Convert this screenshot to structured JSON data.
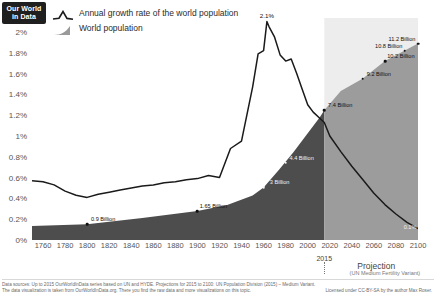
{
  "logo": {
    "line1": "Our World",
    "line2": "in Data"
  },
  "legend": {
    "position": "top-left",
    "items": [
      {
        "label": "Annual growth rate of the world population",
        "icon": "line-peak-icon",
        "color": "#1a1a1a",
        "type": "line"
      },
      {
        "label": "World population",
        "icon": "area-wedge-icon",
        "color": "#9a9a9a",
        "type": "area"
      }
    ]
  },
  "axes": {
    "y_ticks": [
      "0%",
      "0.2%",
      "0.4%",
      "0.6%",
      "0.8%",
      "1%",
      "1.2%",
      "1.4%",
      "1.6%",
      "1.8%",
      "2%"
    ],
    "x_ticks": [
      "1760",
      "1780",
      "1800",
      "1820",
      "1840",
      "1860",
      "1880",
      "1900",
      "1920",
      "1940",
      "1960",
      "1980",
      "2000",
      "2020",
      "2040",
      "2060",
      "2080",
      "2100"
    ]
  },
  "annotations": {
    "marker_year": "2015",
    "projection_title": "Projection",
    "projection_subtitle": "(UN Medium Fertility Variant)",
    "peak_label": "2.1%"
  },
  "footer": {
    "line1": "Data sources: Up to 2015 OurWorldInData series based on UN and HYDE. Projections for 2015 to 2100: UN Population Division (2015) – Medium Variant.",
    "line2": "The data visualization is taken from OurWorldInData.org. There you find the raw data and more visualizations on this topic.",
    "license": "Licensed under CC-BY-SA by the author Max Roser."
  },
  "chart_data": {
    "type": "line",
    "xlabel": "",
    "ylabel": "",
    "xlim": [
      1750,
      2100
    ],
    "ylim": [
      0,
      2.1
    ],
    "grid": false,
    "legend_position": "top-left",
    "series": [
      {
        "name": "Annual growth rate of the world population",
        "unit": "%",
        "color": "#1a1a1a",
        "type": "line",
        "axis": "left",
        "x": [
          1750,
          1760,
          1770,
          1780,
          1790,
          1800,
          1810,
          1820,
          1830,
          1840,
          1850,
          1860,
          1870,
          1880,
          1890,
          1900,
          1910,
          1920,
          1930,
          1940,
          1950,
          1955,
          1960,
          1963,
          1965,
          1970,
          1975,
          1980,
          1985,
          1990,
          1995,
          2000,
          2005,
          2010,
          2015,
          2020,
          2030,
          2040,
          2050,
          2060,
          2070,
          2080,
          2090,
          2100
        ],
        "y": [
          0.57,
          0.56,
          0.53,
          0.47,
          0.43,
          0.41,
          0.44,
          0.46,
          0.48,
          0.5,
          0.52,
          0.53,
          0.55,
          0.56,
          0.58,
          0.59,
          0.62,
          0.6,
          0.88,
          0.95,
          1.47,
          1.79,
          1.82,
          2.1,
          2.05,
          1.95,
          1.78,
          1.72,
          1.74,
          1.6,
          1.45,
          1.3,
          1.23,
          1.18,
          1.13,
          1.0,
          0.85,
          0.71,
          0.58,
          0.45,
          0.34,
          0.25,
          0.17,
          0.11
        ]
      },
      {
        "name": "World population",
        "unit": "Billion",
        "color": "#4f4f4f",
        "projection_color": "#9e9e9e",
        "type": "area",
        "axis": "right",
        "x": [
          1750,
          1800,
          1850,
          1900,
          1927,
          1950,
          1960,
          1974,
          1987,
          1999,
          2011,
          2015,
          2030,
          2050,
          2070,
          2088,
          2100
        ],
        "y": [
          0.79,
          0.9,
          1.26,
          1.65,
          2.0,
          2.54,
          3.0,
          4.0,
          5.0,
          6.0,
          7.0,
          7.4,
          8.5,
          9.2,
          10.2,
          10.8,
          11.2
        ]
      }
    ],
    "data_labels": [
      {
        "year": 1800,
        "text": "0.9 Billion",
        "value": 0.9,
        "series": "World population",
        "style": "dark"
      },
      {
        "year": 1900,
        "text": "1.65 Billion",
        "value": 1.65,
        "series": "World population",
        "style": "dark"
      },
      {
        "year": 1960,
        "text": "3 Billion",
        "value": 3.0,
        "series": "World population",
        "style": "light"
      },
      {
        "year": 1980,
        "text": "4.4 Billion",
        "value": 4.4,
        "series": "World population",
        "style": "light"
      },
      {
        "year": 2015,
        "text": "7.4 Billion",
        "value": 7.4,
        "series": "World population",
        "style": "dark"
      },
      {
        "year": 2050,
        "text": "9.2 Billion",
        "value": 9.2,
        "series": "World population",
        "style": "dark"
      },
      {
        "year": 2070,
        "text": "10.2 Billion",
        "value": 10.2,
        "series": "World population",
        "style": "dark"
      },
      {
        "year": 2088,
        "text": "10.8 Billion",
        "value": 10.8,
        "series": "World population",
        "style": "dark"
      },
      {
        "year": 2100,
        "text": "11.2 Billion",
        "value": 11.2,
        "series": "World population",
        "style": "dark"
      },
      {
        "year": 1963,
        "text": "2.1%",
        "value": 2.1,
        "series": "Annual growth rate of the world population",
        "style": "dark"
      },
      {
        "year": 2100,
        "text": "0.1%",
        "value": 0.11,
        "series": "Annual growth rate of the world population",
        "style": "light"
      }
    ]
  }
}
